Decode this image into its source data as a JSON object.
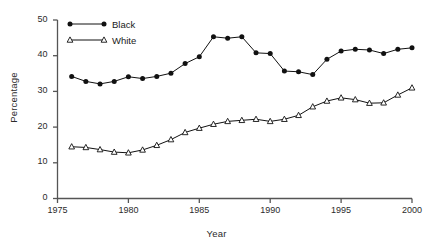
{
  "chart_data": {
    "type": "line",
    "title": "",
    "xlabel": "Year",
    "ylabel": "Percentage",
    "xlim": [
      1975,
      2000
    ],
    "ylim": [
      0,
      50
    ],
    "xticks": [
      1975,
      1980,
      1985,
      1990,
      1995,
      2000
    ],
    "yticks": [
      0,
      10,
      20,
      30,
      40,
      50
    ],
    "grid": false,
    "legend_position": "top-left",
    "x": [
      1976,
      1977,
      1978,
      1979,
      1980,
      1981,
      1982,
      1983,
      1984,
      1985,
      1986,
      1987,
      1988,
      1989,
      1990,
      1991,
      1992,
      1993,
      1994,
      1995,
      1996,
      1997,
      1998,
      1999,
      2000
    ],
    "series": [
      {
        "name": "Black",
        "marker": "filled-circle",
        "color": "#111111",
        "values": [
          34.2,
          32.8,
          32.1,
          32.8,
          34.1,
          33.6,
          34.2,
          35.1,
          37.8,
          39.7,
          45.3,
          44.9,
          45.3,
          40.8,
          40.6,
          35.7,
          35.5,
          34.7,
          39.0,
          41.3,
          41.8,
          41.6,
          40.6,
          41.8,
          42.2
        ]
      },
      {
        "name": "White",
        "marker": "open-triangle",
        "color": "#111111",
        "values": [
          14.5,
          14.3,
          13.7,
          13.0,
          12.8,
          13.6,
          14.9,
          16.5,
          18.5,
          19.7,
          20.8,
          21.6,
          21.9,
          22.2,
          21.6,
          22.2,
          23.3,
          25.7,
          27.3,
          28.2,
          27.7,
          26.7,
          26.8,
          29.0,
          31.0
        ]
      }
    ]
  },
  "legend": {
    "entries": [
      {
        "label": "Black"
      },
      {
        "label": "White"
      }
    ]
  },
  "axes": {
    "y_title": "Percentage",
    "x_title": "Year",
    "y_tick_labels": [
      "50",
      "40",
      "30",
      "20",
      "10",
      "0"
    ],
    "x_tick_labels": [
      "1975",
      "1980",
      "1985",
      "1990",
      "1995",
      "2000"
    ]
  }
}
